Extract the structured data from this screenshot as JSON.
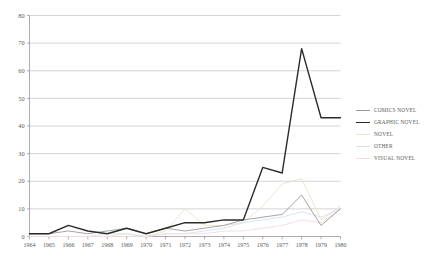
{
  "chart_data": {
    "type": "line",
    "title": "",
    "xlabel": "",
    "ylabel": "",
    "grid": true,
    "legend_position": "right",
    "xlim": [
      1964,
      1980
    ],
    "ylim": [
      0,
      80
    ],
    "yticks": [
      0,
      10,
      20,
      30,
      40,
      50,
      60,
      70,
      80
    ],
    "ytick_labels": [
      "0",
      "10",
      "20",
      "30",
      "40",
      "50",
      "60",
      "70",
      "80"
    ],
    "categories": [
      1964,
      1965,
      1966,
      1967,
      1968,
      1969,
      1970,
      1971,
      1972,
      1973,
      1974,
      1975,
      1976,
      1977,
      1978,
      1979,
      1980
    ],
    "xtick_labels": [
      "1964",
      "1965",
      "1966",
      "1967",
      "1968",
      "1969",
      "1970",
      "1971",
      "1972",
      "1973",
      "1974",
      "1975",
      "1976",
      "1977",
      "1978",
      "1979",
      "1980"
    ],
    "series": [
      {
        "name": "COMICS NOVEL",
        "color": "#9a9a9a",
        "width": 0.9,
        "values": [
          1,
          1,
          2,
          1,
          2,
          3,
          1,
          3,
          2,
          3,
          4,
          6,
          7,
          8,
          15,
          4,
          10
        ]
      },
      {
        "name": "GRAPHIC NOVEL",
        "color": "#2b2b2b",
        "width": 1.4,
        "values": [
          1,
          1,
          4,
          2,
          1,
          3,
          1,
          3,
          5,
          5,
          6,
          6,
          25,
          23,
          68,
          43,
          43
        ]
      },
      {
        "name": "NOVEL",
        "color": "#e8e4c8",
        "width": 0.9,
        "values": [
          0,
          0,
          0,
          0,
          0,
          1,
          0,
          2,
          10,
          4,
          4,
          5,
          11,
          19,
          21,
          6,
          11
        ]
      },
      {
        "name": "OTHER",
        "color": "#d5e2ee",
        "width": 0.9,
        "values": [
          0,
          0,
          0,
          0,
          1,
          1,
          0,
          1,
          1,
          2,
          3,
          5,
          6,
          7,
          9,
          7,
          10
        ]
      },
      {
        "name": "VISUAL NOVEL",
        "color": "#f0dcdc",
        "width": 0.9,
        "values": [
          0,
          0,
          0,
          0,
          0,
          0,
          0,
          1,
          1,
          1,
          2,
          2,
          3,
          4,
          6,
          5,
          10
        ]
      }
    ]
  },
  "legend": {
    "items": [
      {
        "label": "COMICS NOVEL",
        "color": "#9a9a9a",
        "width": 0.9
      },
      {
        "label": "GRAPHIC NOVEL",
        "color": "#2b2b2b",
        "width": 1.8
      },
      {
        "label": "NOVEL",
        "color": "#e8e4c8",
        "width": 0.9
      },
      {
        "label": "OTHER",
        "color": "#d5e2ee",
        "width": 0.9
      },
      {
        "label": "VISUAL NOVEL",
        "color": "#f0dcdc",
        "width": 0.9
      }
    ]
  },
  "axes": {
    "axis_color": "#8a8a8a",
    "grid_color": "#b8b8b8",
    "tick_color": "#8a8a8a"
  }
}
